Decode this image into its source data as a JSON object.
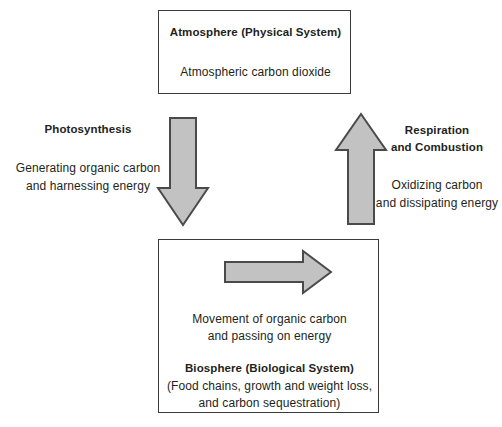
{
  "diagram": {
    "title_semantic": "carbon-cycle-atmosphere-biosphere",
    "colors": {
      "arrow_fill": "#c2c2c2",
      "arrow_stroke": "#4a4a4a",
      "box_stroke": "#3a3a3a",
      "text": "#231f20",
      "background": "#ffffff"
    }
  },
  "atmosphere_box": {
    "heading": "Atmosphere (Physical System)",
    "line1": "Atmospheric carbon dioxide"
  },
  "biosphere_box": {
    "arrow_caption_line1": "Movement of organic carbon",
    "arrow_caption_line2": "and passing on energy",
    "heading": "Biosphere (Biological System)",
    "detail_line1": "(Food chains, growth and weight loss,",
    "detail_line2": "and carbon sequestration)"
  },
  "left_label": {
    "heading": "Photosynthesis",
    "line1": "Generating organic carbon",
    "line2": "and harnessing energy"
  },
  "right_label": {
    "heading_line1": "Respiration",
    "heading_line2": "and Combustion",
    "line1": "Oxidizing carbon",
    "line2": "and dissipating energy"
  },
  "arrows": {
    "down": "down-arrow",
    "up": "up-arrow",
    "right": "right-arrow"
  }
}
